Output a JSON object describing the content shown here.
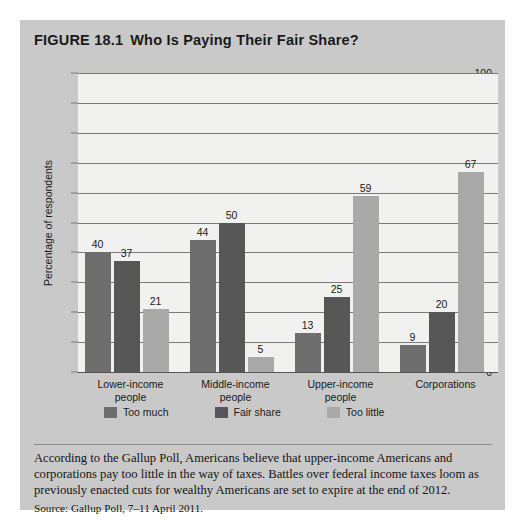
{
  "figure": {
    "number": "FIGURE 18.1",
    "title": "Who Is Paying Their Fair Share?"
  },
  "caption": {
    "body": "According to the Gallup Poll, Americans believe that upper-income Americans and corporations pay too little in the way of taxes. Battles over federal income taxes loom as previously enacted cuts for wealthy Americans are set to expire at the end of 2012.",
    "source": "Source: Gallup Poll, 7–11 April 2011."
  },
  "colors": {
    "too_much": "#6e6e6e",
    "fair_share": "#575757",
    "too_little": "#a9a9a9",
    "figure_background": "#c9c9c9",
    "plot_background": "#f1f1ef",
    "gridline": "#7a7a7a"
  },
  "chart_data": {
    "type": "bar",
    "title": "Who Is Paying Their Fair Share?",
    "xlabel": "",
    "ylabel": "Percentage of respondents",
    "ylim": [
      0,
      100
    ],
    "yticks": [
      0,
      10,
      20,
      30,
      40,
      50,
      60,
      70,
      80,
      90,
      100
    ],
    "ytick_labels": [
      "0",
      "10",
      "20",
      "30",
      "40",
      "50",
      "60",
      "70",
      "80",
      "90",
      "100"
    ],
    "grid": true,
    "legend_position": "bottom-left",
    "categories": [
      "Lower-income people",
      "Middle-income people",
      "Upper-income people",
      "Corporations"
    ],
    "category_lines": [
      [
        "Lower-income",
        "people"
      ],
      [
        "Middle-income",
        "people"
      ],
      [
        "Upper-income",
        "people"
      ],
      [
        "Corporations",
        ""
      ]
    ],
    "series": [
      {
        "name": "Too much",
        "color": "#6e6e6e",
        "values": [
          40,
          44,
          13,
          9
        ]
      },
      {
        "name": "Fair share",
        "color": "#575757",
        "values": [
          37,
          50,
          25,
          20
        ]
      },
      {
        "name": "Too little",
        "color": "#a9a9a9",
        "values": [
          21,
          5,
          59,
          67
        ]
      }
    ]
  }
}
